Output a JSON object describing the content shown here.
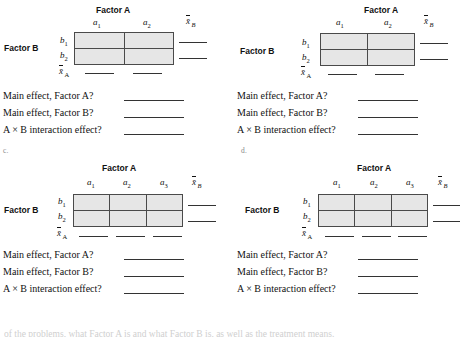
{
  "page": {
    "background": "#ffffff",
    "cell_fill": "#e6e6e6",
    "rule_color": "#4a4a4a",
    "footer_partial_text": "of the problems, what Factor A is and what Factor B is, as well as the treatment means."
  },
  "labels": {
    "factor_a_title": "Factor A",
    "factor_b_title": "Factor B",
    "xbar_b": "x̄",
    "xbar_b_sub": "B",
    "xbar_a": "x̄",
    "xbar_a_sub": "A",
    "row_b1": "b",
    "row_b1_sub": "1",
    "row_b2": "b",
    "row_b2_sub": "2",
    "col_a1": "a",
    "col_a1_sub": "1",
    "col_a2": "a",
    "col_a2_sub": "2",
    "col_a3": "a",
    "col_a3_sub": "3"
  },
  "questions": {
    "main_effect_a": "Main effect, Factor A?",
    "main_effect_b": "Main effect, Factor B?",
    "interaction": "A × B interaction effect?"
  },
  "panels": [
    {
      "id": "a",
      "letter": "",
      "columns": 2,
      "rows": 2,
      "column_labels": [
        "a1",
        "a2"
      ],
      "row_labels": [
        "b1",
        "b2"
      ]
    },
    {
      "id": "b",
      "letter": "",
      "columns": 2,
      "rows": 2,
      "column_labels": [
        "a1",
        "a2"
      ],
      "row_labels": [
        "b1",
        "b2"
      ]
    },
    {
      "id": "c",
      "letter": "c.",
      "columns": 3,
      "rows": 2,
      "column_labels": [
        "a1",
        "a2",
        "a3"
      ],
      "row_labels": [
        "b1",
        "b2"
      ]
    },
    {
      "id": "d",
      "letter": "d.",
      "columns": 3,
      "rows": 2,
      "column_labels": [
        "a1",
        "a2",
        "a3"
      ],
      "row_labels": [
        "b1",
        "b2"
      ]
    }
  ]
}
